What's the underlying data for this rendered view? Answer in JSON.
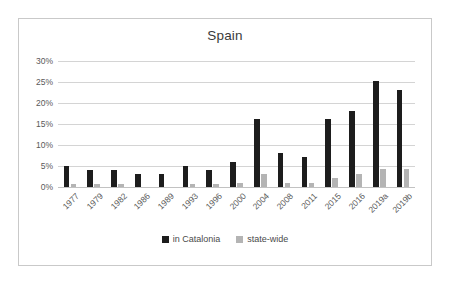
{
  "chart_data": {
    "type": "bar",
    "title": "Spain",
    "xlabel": "",
    "ylabel": "",
    "ylim": [
      0,
      30
    ],
    "ytick_labels": [
      "0%",
      "5%",
      "10%",
      "15%",
      "20%",
      "25%",
      "30%"
    ],
    "ytick_values": [
      0,
      5,
      10,
      15,
      20,
      25,
      30
    ],
    "grid": true,
    "legend_position": "bottom",
    "categories": [
      "1977",
      "1979",
      "1982",
      "1986",
      "1989",
      "1993",
      "1996",
      "2000",
      "2004",
      "2008",
      "2011",
      "2015",
      "2016",
      "2019a",
      "2019b"
    ],
    "series": [
      {
        "name": "in Catalonia",
        "color": "#1d1d1d",
        "values": [
          4.9,
          4.1,
          4.1,
          3.0,
          3.0,
          5.0,
          4.1,
          6.0,
          16.1,
          8.2,
          7.1,
          16.1,
          18.2,
          25.2,
          23.2
        ]
      },
      {
        "name": "state-wide",
        "color": "#b4b4b4",
        "values": [
          0.7,
          0.7,
          0.7,
          0.0,
          0.0,
          0.7,
          0.8,
          0.9,
          3.1,
          0.9,
          1.0,
          2.2,
          3.2,
          4.3,
          4.3
        ]
      }
    ]
  },
  "legend": {
    "items": [
      {
        "label": "in Catalonia",
        "swatch": "dark-square-icon"
      },
      {
        "label": "state-wide",
        "swatch": "gray-square-icon"
      }
    ]
  },
  "colors": {
    "series_catalonia": "#1d1d1d",
    "series_statewide": "#b4b4b4",
    "gridline": "#d4d4d4",
    "frame_border": "#c9c9c9",
    "text": "#595959",
    "background": "#ffffff"
  }
}
